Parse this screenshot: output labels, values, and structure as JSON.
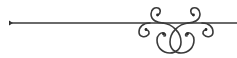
{
  "ornament": {
    "kind": "decorative flourish divider",
    "description": "Horizontal rule with arrowhead at left end and symmetric scroll curls on the right",
    "stroke_color": "#3a3a3a",
    "background": "#ffffff"
  }
}
